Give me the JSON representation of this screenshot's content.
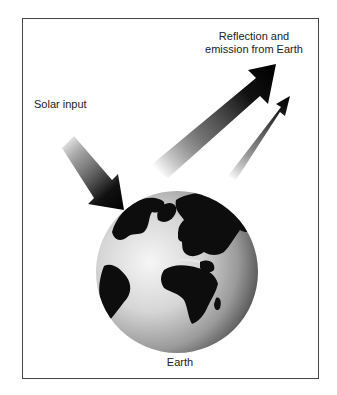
{
  "diagram": {
    "labels": {
      "reflection_line1": "Reflection and",
      "reflection_line2": "emission from Earth",
      "solar_input": "Solar input",
      "earth": "Earth"
    },
    "elements": {
      "solar_arrow": "solar-input-arrow",
      "reflection_arrow_large": "reflection-arrow",
      "emission_arrow_small": "emission-arrow",
      "globe": "earth-globe"
    },
    "colors": {
      "frame": "#444444",
      "arrow_dark": "#111111",
      "globe_light": "#f2f2f2",
      "globe_dark": "#6a6a6a",
      "land": "#0d0d0d",
      "text": "#222222"
    }
  }
}
